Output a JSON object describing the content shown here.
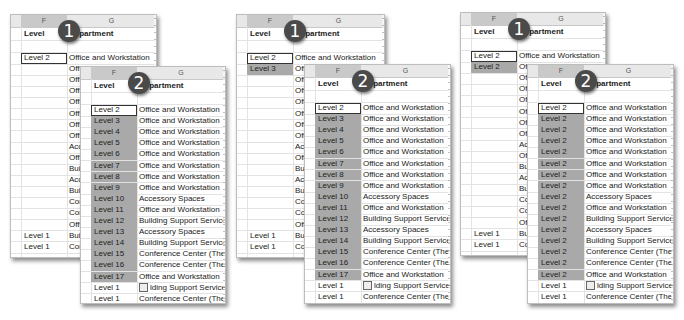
{
  "columns": {
    "f": "F",
    "g": "G"
  },
  "header_row": {
    "level": "Level",
    "department": "Department",
    "department_visible": "partment"
  },
  "badges": {
    "one": "1",
    "two": "2"
  },
  "paste_icon": "paste-options-icon",
  "groups": [
    {
      "back": {
        "f_col": [
          "Level 2",
          "",
          "",
          "",
          "",
          "",
          "",
          "",
          "",
          "",
          "",
          "",
          "",
          "",
          "",
          "",
          "Level 1",
          "Level 1"
        ],
        "g_col": [
          "Office and Workstation",
          "Office",
          "Office",
          "Office",
          "Office",
          "Office",
          "Office",
          "Office",
          "Acces",
          "Office",
          "Build",
          "Acces",
          "Build",
          "Confe",
          "Confe",
          "Office",
          "Build",
          "Confe"
        ],
        "selected_rows": [
          0
        ]
      },
      "front": {
        "f_col": [
          "Level 2",
          "Level 3",
          "Level 4",
          "Level 5",
          "Level 6",
          "Level 7",
          "Level 8",
          "Level 9",
          "Level 10",
          "Level 11",
          "Level 12",
          "Level 13",
          "Level 14",
          "Level 15",
          "Level 16",
          "Level 17",
          "Level 1",
          "Level 1"
        ],
        "g_col": [
          "Office and Workstation",
          "Office and Workstation",
          "Office and Workstation",
          "Office and Workstation",
          "Office and Workstation",
          "Office and Workstation",
          "Office and Workstation",
          "Office and Workstation",
          "Accessory Spaces",
          "Office and Workstation",
          "Building Support Services Sp",
          "Accessory Spaces",
          "Building Support Services Sp",
          "Conference Center (The fron",
          "Conference Center (The fron",
          "Office and Workstation",
          "lding Support Services Sp",
          "Conference Center (The fron"
        ]
      }
    },
    {
      "back": {
        "f_col": [
          "Level 2",
          "Level 3",
          "",
          "",
          "",
          "",
          "",
          "",
          "",
          "",
          "",
          "",
          "",
          "",
          "",
          "",
          "Level 1",
          "Level 1"
        ],
        "g_col": [
          "Office and Workstation",
          "Offic",
          "Offic",
          "Offic",
          "Offic",
          "Offic",
          "Offic",
          "Offic",
          "Acce",
          "Offic",
          "Build",
          "Acce",
          "Build",
          "Conf",
          "Conf",
          "Offic",
          "Build",
          "Conf"
        ],
        "selected_rows": [
          0,
          1
        ]
      },
      "front": {
        "f_col": [
          "Level 2",
          "Level 3",
          "Level 4",
          "Level 5",
          "Level 6",
          "Level 7",
          "Level 8",
          "Level 9",
          "Level 10",
          "Level 11",
          "Level 12",
          "Level 13",
          "Level 14",
          "Level 15",
          "Level 16",
          "Level 17",
          "Level 1",
          "Level 1"
        ],
        "g_col": [
          "Office and Workstation",
          "Office and Workstation",
          "Office and Workstation",
          "Office and Workstation",
          "Office and Workstation",
          "Office and Workstation",
          "Office and Workstation",
          "Office and Workstation",
          "Accessory Spaces",
          "Office and Workstation",
          "Building Support Services Sp",
          "Accessory Spaces",
          "Building Support Services Sp",
          "Conference Center (The fron",
          "Conference Center (The fron",
          "Office and Workstation",
          "lding Support Services Sp",
          "Conference Center (The fron"
        ]
      }
    },
    {
      "back": {
        "f_col": [
          "Level 2",
          "Level 2",
          "",
          "",
          "",
          "",
          "",
          "",
          "",
          "",
          "",
          "",
          "",
          "",
          "",
          "",
          "Level 1",
          "Level 1"
        ],
        "g_col": [
          "Office and Workstation",
          "Offic",
          "Offic",
          "Offic",
          "Offic",
          "Offic",
          "Offic",
          "Offic",
          "Acce",
          "Offic",
          "Build",
          "Acce",
          "Build",
          "Conf",
          "Conf",
          "Offic",
          "Build",
          "Conf"
        ],
        "selected_rows": [
          0,
          1
        ]
      },
      "front": {
        "f_col": [
          "Level 2",
          "Level 2",
          "Level 2",
          "Level 2",
          "Level 2",
          "Level 2",
          "Level 2",
          "Level 2",
          "Level 2",
          "Level 2",
          "Level 2",
          "Level 2",
          "Level 2",
          "Level 2",
          "Level 2",
          "Level 2",
          "Level 1",
          "Level 1"
        ],
        "g_col": [
          "Office and Workstation",
          "Office and Workstation",
          "Office and Workstation",
          "Office and Workstation",
          "Office and Workstation",
          "Office and Workstation",
          "Office and Workstation",
          "Office and Workstation",
          "Accessory Spaces",
          "Office and Workstation",
          "Building Support Services Sp",
          "Accessory Spaces",
          "Building Support Services Sp",
          "Conference Center (The fron",
          "Conference Center (The fron",
          "Office and Workstation",
          "lding Support Services Sp",
          "Conference Center (The fron"
        ]
      }
    }
  ],
  "colors": {
    "selection": "#a9a9a9",
    "header_bg": "#e8e8e8",
    "badge": "#4a4a4a"
  }
}
